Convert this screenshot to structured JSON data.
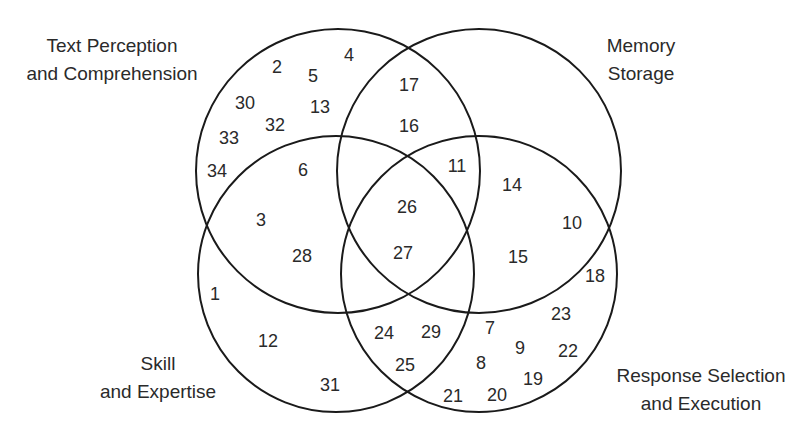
{
  "diagram": {
    "type": "venn-4-set",
    "sets": [
      {
        "id": "text",
        "label_lines": [
          "Text Perception",
          "and Comprehension"
        ],
        "circle": {
          "cx": 338,
          "cy": 171,
          "r": 142
        },
        "label_pos": {
          "x": 112,
          "y1": 52,
          "y2": 80
        }
      },
      {
        "id": "memory",
        "label_lines": [
          "Memory",
          "Storage"
        ],
        "circle": {
          "cx": 479,
          "cy": 171,
          "r": 142
        },
        "label_pos": {
          "x": 641,
          "y1": 52,
          "y2": 80
        }
      },
      {
        "id": "skill",
        "label_lines": [
          "Skill",
          "and Expertise"
        ],
        "circle": {
          "cx": 336,
          "cy": 274,
          "r": 138
        },
        "label_pos": {
          "x": 158,
          "y1": 370,
          "y2": 398
        }
      },
      {
        "id": "response",
        "label_lines": [
          "Response Selection",
          "and Execution"
        ],
        "circle": {
          "cx": 479,
          "cy": 274,
          "r": 138
        },
        "label_pos": {
          "x": 701,
          "y1": 382,
          "y2": 410
        }
      }
    ],
    "items": [
      {
        "n": "2",
        "x": 277,
        "y": 68,
        "sets": [
          "text"
        ]
      },
      {
        "n": "5",
        "x": 313,
        "y": 77,
        "sets": [
          "text"
        ]
      },
      {
        "n": "4",
        "x": 349,
        "y": 56,
        "sets": [
          "text"
        ]
      },
      {
        "n": "30",
        "x": 245,
        "y": 104,
        "sets": [
          "text"
        ]
      },
      {
        "n": "13",
        "x": 320,
        "y": 108,
        "sets": [
          "text"
        ]
      },
      {
        "n": "32",
        "x": 275,
        "y": 126,
        "sets": [
          "text"
        ]
      },
      {
        "n": "33",
        "x": 229,
        "y": 139,
        "sets": [
          "text"
        ]
      },
      {
        "n": "34",
        "x": 217,
        "y": 172,
        "sets": [
          "text"
        ]
      },
      {
        "n": "17",
        "x": 409,
        "y": 86,
        "sets": [
          "text",
          "memory"
        ]
      },
      {
        "n": "16",
        "x": 409,
        "y": 127,
        "sets": [
          "text",
          "memory"
        ]
      },
      {
        "n": "6",
        "x": 303,
        "y": 171,
        "sets": [
          "text",
          "skill"
        ]
      },
      {
        "n": "3",
        "x": 261,
        "y": 221,
        "sets": [
          "text",
          "skill"
        ]
      },
      {
        "n": "28",
        "x": 302,
        "y": 257,
        "sets": [
          "text",
          "skill"
        ]
      },
      {
        "n": "11",
        "x": 457,
        "y": 167,
        "sets": [
          "text",
          "memory",
          "response"
        ]
      },
      {
        "n": "26",
        "x": 407,
        "y": 208,
        "sets": [
          "text",
          "memory",
          "skill",
          "response"
        ]
      },
      {
        "n": "27",
        "x": 403,
        "y": 254,
        "sets": [
          "text",
          "memory",
          "skill",
          "response"
        ]
      },
      {
        "n": "14",
        "x": 512,
        "y": 186,
        "sets": [
          "memory",
          "response"
        ]
      },
      {
        "n": "10",
        "x": 572,
        "y": 224,
        "sets": [
          "memory"
        ]
      },
      {
        "n": "15",
        "x": 518,
        "y": 258,
        "sets": [
          "memory",
          "response"
        ]
      },
      {
        "n": "18",
        "x": 595,
        "y": 277,
        "sets": [
          "response"
        ]
      },
      {
        "n": "1",
        "x": 215,
        "y": 295,
        "sets": [
          "skill"
        ]
      },
      {
        "n": "12",
        "x": 268,
        "y": 342,
        "sets": [
          "skill"
        ]
      },
      {
        "n": "31",
        "x": 330,
        "y": 386,
        "sets": [
          "skill"
        ]
      },
      {
        "n": "24",
        "x": 384,
        "y": 334,
        "sets": [
          "skill",
          "response"
        ]
      },
      {
        "n": "29",
        "x": 431,
        "y": 333,
        "sets": [
          "skill",
          "response"
        ]
      },
      {
        "n": "25",
        "x": 405,
        "y": 366,
        "sets": [
          "skill",
          "response"
        ]
      },
      {
        "n": "7",
        "x": 490,
        "y": 329,
        "sets": [
          "response"
        ]
      },
      {
        "n": "23",
        "x": 561,
        "y": 315,
        "sets": [
          "response"
        ]
      },
      {
        "n": "9",
        "x": 520,
        "y": 349,
        "sets": [
          "response"
        ]
      },
      {
        "n": "22",
        "x": 568,
        "y": 352,
        "sets": [
          "response"
        ]
      },
      {
        "n": "8",
        "x": 481,
        "y": 364,
        "sets": [
          "response"
        ]
      },
      {
        "n": "19",
        "x": 533,
        "y": 380,
        "sets": [
          "response"
        ]
      },
      {
        "n": "21",
        "x": 453,
        "y": 397,
        "sets": [
          "response"
        ]
      },
      {
        "n": "20",
        "x": 497,
        "y": 396,
        "sets": [
          "response"
        ]
      }
    ]
  },
  "style": {
    "line_color": "#1a1a1a",
    "text_color": "#2a2a2a",
    "background": "#ffffff"
  }
}
